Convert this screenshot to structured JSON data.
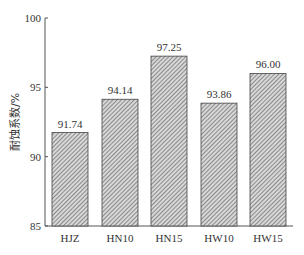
{
  "chart_data": {
    "type": "bar",
    "title": "",
    "xlabel": "",
    "ylabel": "耐蚀系数/%",
    "ylim": [
      85,
      100
    ],
    "yticks": [
      85,
      90,
      95,
      100
    ],
    "categories": [
      "HJZ",
      "HN10",
      "HN15",
      "HW10",
      "HW15"
    ],
    "values": [
      91.74,
      94.14,
      97.25,
      93.86,
      96.0
    ],
    "value_labels": [
      "91.74",
      "94.14",
      "97.25",
      "93.86",
      "96.00"
    ],
    "grid": false,
    "legend": null,
    "bar_fill": "hatched gray"
  },
  "axis": {
    "ylabel": "耐蚀系数/%",
    "yticks": [
      "85",
      "90",
      "95",
      "100"
    ]
  }
}
